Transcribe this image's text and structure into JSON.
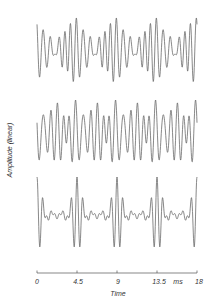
{
  "chart_data": {
    "type": "line",
    "title": "",
    "xlabel": "Time",
    "ylabel": "Amplitude (linear)",
    "x_unit": "ms",
    "xlim": [
      0,
      18
    ],
    "xticks": [
      0,
      4.5,
      9,
      13.5,
      18
    ],
    "xtick_labels": [
      "0",
      "4.5",
      "9",
      "13.5",
      "18"
    ],
    "grid": false,
    "legend": "none",
    "period_ms": 4.5,
    "series": [
      {
        "name": "waveform 1 (top)",
        "harmonics": [
          {
            "n": 6,
            "amp": 1.0,
            "phase": 0.0
          },
          {
            "n": 7,
            "amp": 0.9,
            "phase": 0.5
          },
          {
            "n": 5,
            "amp": 0.55,
            "phase": 1.1
          },
          {
            "n": 8,
            "amp": 0.45,
            "phase": 2.0
          }
        ]
      },
      {
        "name": "waveform 2 (middle)",
        "harmonics": [
          {
            "n": 6,
            "amp": 1.0,
            "phase": 0.3
          },
          {
            "n": 5,
            "amp": 0.8,
            "phase": 1.6
          },
          {
            "n": 7,
            "amp": 0.7,
            "phase": 2.4
          },
          {
            "n": 4,
            "amp": 0.35,
            "phase": 0.9
          }
        ]
      },
      {
        "name": "waveform 3 (bottom)",
        "harmonics": [
          {
            "n": 6,
            "amp": 0.7,
            "phase": 0.0
          },
          {
            "n": 7,
            "amp": 0.7,
            "phase": 0.0
          },
          {
            "n": 8,
            "amp": 0.6,
            "phase": 0.0
          },
          {
            "n": 5,
            "amp": 0.5,
            "phase": 0.0
          },
          {
            "n": 9,
            "amp": 0.4,
            "phase": 0.0
          }
        ]
      }
    ]
  },
  "axis": {
    "xlabel": "Time",
    "ylabel": "Amplitude (linear)",
    "unit": "ms",
    "ticks": [
      "0",
      "4.5",
      "9",
      "13.5",
      "18"
    ]
  },
  "colors": {
    "trace": "#6a6a6a",
    "axis": "#555555"
  }
}
